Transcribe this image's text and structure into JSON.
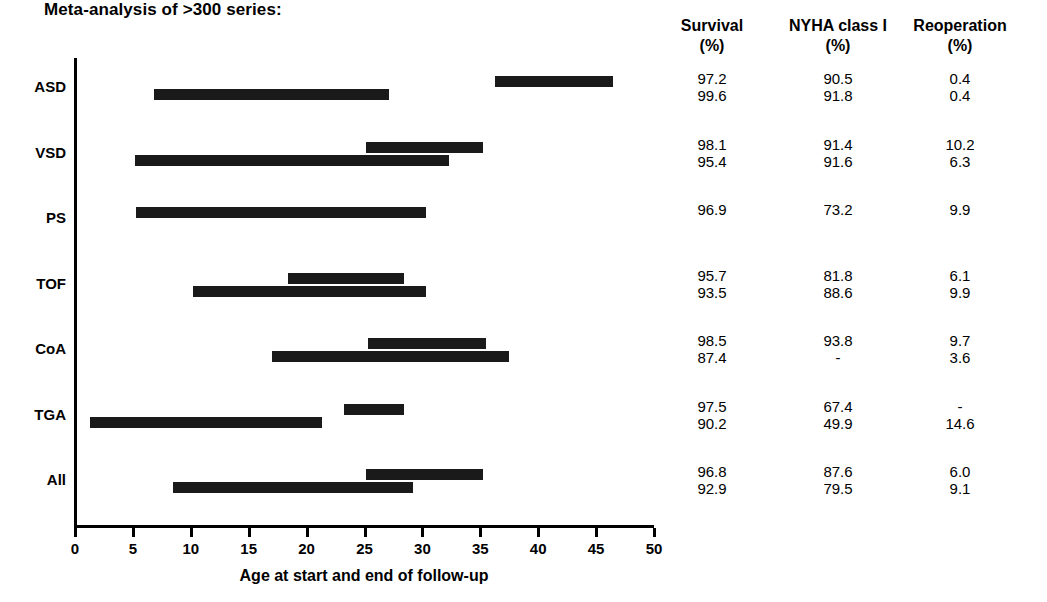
{
  "title": "Meta-analysis of >300 series:",
  "chart_data": {
    "type": "bar",
    "title": "Meta-analysis of >300 series:",
    "xlabel": "Age at start and end of follow-up",
    "ylabel": "",
    "xlim": [
      0,
      50
    ],
    "grid": false,
    "legend": "none",
    "orientation": "horizontal-range",
    "xticks": [
      0,
      5,
      10,
      15,
      20,
      25,
      30,
      35,
      40,
      45,
      50
    ],
    "categories": [
      "ASD",
      "VSD",
      "PS",
      "TOF",
      "CoA",
      "TGA",
      "All"
    ],
    "rows": [
      {
        "category": "ASD",
        "bars": [
          {
            "start": 36.3,
            "end": 46.5
          },
          {
            "start": 6.8,
            "end": 27.1
          }
        ],
        "survival": [
          "97.2",
          "99.6"
        ],
        "nyha_class_i": [
          "90.5",
          "91.8"
        ],
        "reoperation": [
          "0.4",
          "0.4"
        ]
      },
      {
        "category": "VSD",
        "bars": [
          {
            "start": 25.1,
            "end": 35.2
          },
          {
            "start": 5.2,
            "end": 32.3
          }
        ],
        "survival": [
          "98.1",
          "95.4"
        ],
        "nyha_class_i": [
          "91.4",
          "91.6"
        ],
        "reoperation": [
          "10.2",
          "6.3"
        ]
      },
      {
        "category": "PS",
        "bars": [
          {
            "start": 5.3,
            "end": 30.3
          }
        ],
        "survival": [
          "96.9"
        ],
        "nyha_class_i": [
          "73.2"
        ],
        "reoperation": [
          "9.9"
        ]
      },
      {
        "category": "TOF",
        "bars": [
          {
            "start": 18.4,
            "end": 28.4
          },
          {
            "start": 10.2,
            "end": 30.3
          }
        ],
        "survival": [
          "95.7",
          "93.5"
        ],
        "nyha_class_i": [
          "81.8",
          "88.6"
        ],
        "reoperation": [
          "6.1",
          "9.9"
        ]
      },
      {
        "category": "CoA",
        "bars": [
          {
            "start": 25.3,
            "end": 35.5
          },
          {
            "start": 17.0,
            "end": 37.5
          }
        ],
        "survival": [
          "98.5",
          "87.4"
        ],
        "nyha_class_i": [
          "93.8",
          "-"
        ],
        "reoperation": [
          "9.7",
          "3.6"
        ]
      },
      {
        "category": "TGA",
        "bars": [
          {
            "start": 23.2,
            "end": 28.4
          },
          {
            "start": 1.3,
            "end": 21.3
          }
        ],
        "survival": [
          "97.5",
          "90.2"
        ],
        "nyha_class_i": [
          "67.4",
          "49.9"
        ],
        "reoperation": [
          "-",
          "14.6"
        ]
      },
      {
        "category": "All",
        "bars": [
          {
            "start": 25.1,
            "end": 35.2
          },
          {
            "start": 8.5,
            "end": 29.2
          }
        ],
        "survival": [
          "96.8",
          "92.9"
        ],
        "nyha_class_i": [
          "87.6",
          "79.5"
        ],
        "reoperation": [
          "6.0",
          "9.1"
        ]
      }
    ],
    "columns": [
      {
        "key": "survival",
        "label": "Survival",
        "unit": "(%)"
      },
      {
        "key": "nyha_class_i",
        "label": "NYHA class I",
        "unit": "(%)"
      },
      {
        "key": "reoperation",
        "label": "Reoperation",
        "unit": "(%)"
      }
    ],
    "bar_color": "#1a1a1a"
  }
}
